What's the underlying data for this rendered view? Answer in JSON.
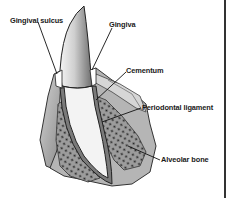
{
  "diagram": {
    "type": "anatomical-illustration",
    "labels": [
      {
        "id": "gingival-sulcus",
        "text": "Gingival sulcus"
      },
      {
        "id": "gingiva",
        "text": "Gingiva"
      },
      {
        "id": "cementum",
        "text": "Cementum"
      },
      {
        "id": "periodontal-ligament",
        "text": "Periodontal ligament"
      },
      {
        "id": "alveolar-bone",
        "text": "Alveolar bone"
      }
    ],
    "colors": {
      "ink": "#1a1a1a",
      "gum": "#9a9a9a",
      "gum_light": "#c8c8c8",
      "bone_dots": "#222222",
      "root": "#f2f2f2",
      "crown": "#d9d9d9",
      "frame": "#333333"
    }
  }
}
